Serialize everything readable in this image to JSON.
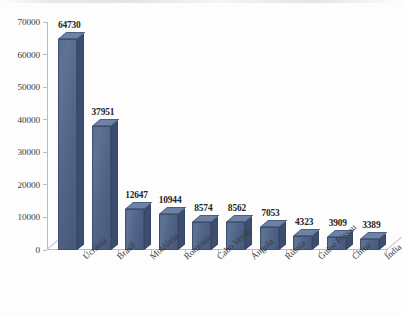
{
  "chart_data": {
    "type": "bar",
    "title": "",
    "subtitle": "",
    "xlabel": "",
    "ylabel": "",
    "categories": [
      "Ucrânia",
      "Brasil",
      "Moldávia",
      "Roménia",
      "Cabo Verde",
      "Angola",
      "Rússia",
      "Guiné Bissau",
      "China",
      "Índia"
    ],
    "values": [
      64730,
      37951,
      12647,
      10944,
      8574,
      8562,
      7053,
      4323,
      3909,
      3389
    ],
    "data_labels": [
      "64730",
      "37951",
      "12647",
      "10944",
      "8574",
      "8562",
      "7053",
      "4323",
      "3909",
      "3389"
    ],
    "ylim": [
      0,
      70000
    ],
    "ytick_values": [
      0,
      10000,
      20000,
      30000,
      40000,
      50000,
      60000,
      70000
    ],
    "ytick_labels": [
      "0",
      "10000",
      "20000",
      "30000",
      "40000",
      "50000",
      "60000",
      "70000"
    ],
    "grid": false,
    "legend": false,
    "legend_position": "none",
    "style": "3d-column",
    "series_name": "",
    "colors": {
      "bar_front": "#52668a",
      "bar_top": "#6e82a6",
      "bar_side": "#3c4d6d",
      "bar_outline": "#3e4f70",
      "axis": "#b9bcc4",
      "text": "#3a3a3c",
      "value_text": "#24262b",
      "background": "#fdfdfd"
    }
  }
}
